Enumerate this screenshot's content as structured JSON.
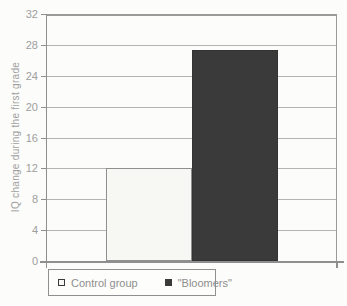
{
  "chart_data": {
    "type": "bar",
    "title": "",
    "xlabel": "",
    "ylabel": "IQ change during the first grade",
    "ylim": [
      0,
      32
    ],
    "yticks": [
      0,
      4,
      8,
      12,
      16,
      20,
      24,
      28,
      32
    ],
    "grid": true,
    "legend_position": "bottom-left",
    "categories": [
      "IQ change during the first grade"
    ],
    "series": [
      {
        "name": "Control group",
        "value": 12,
        "fill": "#f7f7f4",
        "border": "#8f8f8f"
      },
      {
        "name": "\"Bloomers\"",
        "value": 27.4,
        "fill": "#3a3a3a",
        "border": "#333333"
      }
    ]
  },
  "colors": {
    "background": "#fcfcfa",
    "gridline": "#b3b3b3",
    "axis": "#8f8f8f",
    "tick_label": "#9e9e9e",
    "legend_text": "#8e8e8e"
  }
}
